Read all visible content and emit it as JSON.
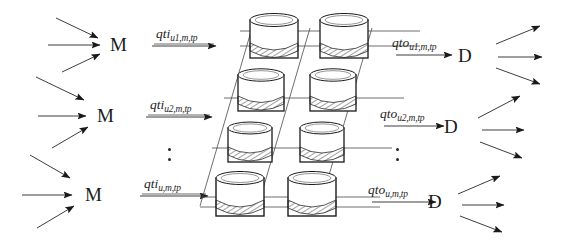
{
  "figure": {
    "type": "schematic-flow-diagram",
    "background_color": "#ffffff",
    "ink_color": "#1a1a1a"
  },
  "sources": {
    "symbol": "M",
    "nodes": [
      {
        "label": "M",
        "inbound_arrows": 3
      },
      {
        "label": "M",
        "inbound_arrows": 3
      },
      {
        "label": "M",
        "inbound_arrows": 3
      }
    ]
  },
  "sinks": {
    "symbol": "D",
    "nodes": [
      {
        "label": "D",
        "outbound_arrows": 3
      },
      {
        "label": "D",
        "outbound_arrows": 3
      },
      {
        "label": "D",
        "outbound_arrows": 3
      }
    ]
  },
  "inflow_labels": [
    {
      "base": "qti",
      "subscript": "u1,m,tp"
    },
    {
      "base": "qti",
      "subscript": "u2,m,tp"
    },
    {
      "base": "qti",
      "subscript": "u,m,tp"
    }
  ],
  "outflow_labels": [
    {
      "base": "qto",
      "subscript": "u1,m,tp"
    },
    {
      "base": "qto",
      "subscript": "u2,m,tp"
    },
    {
      "base": "qto",
      "subscript": "u,m,tp"
    }
  ],
  "ellipsis": {
    "left": {
      "dots": 2
    },
    "right": {
      "dots": 2
    }
  },
  "tank_grid": {
    "rows": 4,
    "columns": 2,
    "tank_style": "cylinder-with-hatched-liquid",
    "perspective": "parallelogram"
  }
}
